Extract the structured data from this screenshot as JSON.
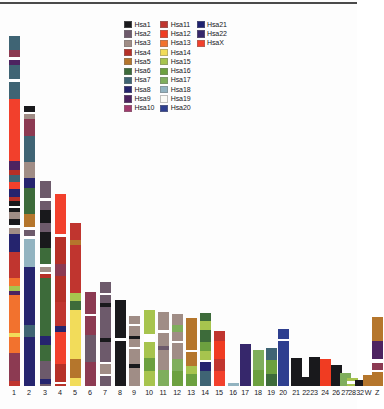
{
  "figure": {
    "title": "",
    "background": "#fdfdfd",
    "top_rule_color": "#4a4a4a"
  },
  "legend": {
    "position": "top-center",
    "columns": [
      [
        {
          "label": "Hsa1",
          "color": "#19191c"
        },
        {
          "label": "Hsa2",
          "color": "#6d5a6b"
        },
        {
          "label": "Hsa3",
          "color": "#a08d86"
        },
        {
          "label": "Hsa4",
          "color": "#b63027"
        },
        {
          "label": "Hsa5",
          "color": "#b5762c"
        },
        {
          "label": "Hsa6",
          "color": "#3d6b3a"
        },
        {
          "label": "Hsa7",
          "color": "#3f6474"
        },
        {
          "label": "Hsa8",
          "color": "#25246e"
        },
        {
          "label": "Hsa9",
          "color": "#4d2360"
        },
        {
          "label": "Hsa10",
          "color": "#a23b6e"
        }
      ],
      [
        {
          "label": "Hsa11",
          "color": "#c0352f"
        },
        {
          "label": "Hsa12",
          "color": "#f03c22"
        },
        {
          "label": "Hsa13",
          "color": "#f2722e"
        },
        {
          "label": "Hsa14",
          "color": "#f2dc5a"
        },
        {
          "label": "Hsa15",
          "color": "#a7c44e"
        },
        {
          "label": "Hsa16",
          "color": "#6ca03f"
        },
        {
          "label": "Hsa17",
          "color": "#7fae5c"
        },
        {
          "label": "Hsa18",
          "color": "#92b3c0"
        },
        {
          "label": "Hsa19",
          "color": "#fbfbf6"
        },
        {
          "label": "Hsa20",
          "color": "#2e3f8f"
        }
      ],
      [
        {
          "label": "Hsa21",
          "color": "#1e2270"
        },
        {
          "label": "Hsa22",
          "color": "#36276b"
        },
        {
          "label": "HsaX",
          "color": "#f2402c"
        }
      ]
    ]
  },
  "chart_data": {
    "type": "bar",
    "subtype": "stacked-chromosome-painting",
    "title": "",
    "xlabel": "",
    "ylabel": "",
    "grid": false,
    "legend_position": "top-center",
    "categories": [
      "1",
      "2",
      "3",
      "4",
      "5",
      "6",
      "7",
      "8",
      "9",
      "10",
      "11",
      "12",
      "13",
      "14",
      "15",
      "16",
      "17",
      "18",
      "19",
      "20",
      "21",
      "22",
      "23",
      "24",
      "26",
      "27",
      "28",
      "32",
      "W",
      "Z"
    ],
    "values": [
      359,
      280,
      205,
      192,
      163,
      94,
      104,
      86,
      70,
      76,
      74,
      72,
      68,
      73,
      55,
      3,
      42,
      36,
      38,
      57,
      28,
      9,
      29,
      27,
      21,
      13,
      8,
      6,
      11,
      69
    ],
    "ylim": [
      0,
      372
    ],
    "bar_left_px": [
      14,
      29,
      45,
      60,
      75,
      90,
      105,
      120,
      134,
      149,
      163,
      177,
      191,
      205,
      219,
      233,
      245,
      258,
      271,
      283,
      296,
      306,
      314,
      325,
      336,
      345,
      352,
      360,
      368,
      377
    ],
    "bars": [
      {
        "name": "1",
        "total": 359,
        "segments": [
          {
            "color": "#3f6474",
            "h": 14
          },
          {
            "color": "#8c3a52",
            "h": 7
          },
          {
            "color": "#ffffff",
            "h": 3
          },
          {
            "color": "#4d2360",
            "h": 5
          },
          {
            "color": "#3f6474",
            "h": 14
          },
          {
            "color": "#ffffff",
            "h": 3
          },
          {
            "color": "#3f6474",
            "h": 17
          },
          {
            "color": "#f2402c",
            "h": 62
          },
          {
            "color": "#4d2360",
            "h": 9
          },
          {
            "color": "#b63027",
            "h": 5
          },
          {
            "color": "#3f6474",
            "h": 7
          },
          {
            "color": "#f2402c",
            "h": 7
          },
          {
            "color": "#25246e",
            "h": 8
          },
          {
            "color": "#b63027",
            "h": 4
          },
          {
            "color": "#19191c",
            "h": 5
          },
          {
            "color": "#ffffff",
            "h": 2
          },
          {
            "color": "#19191c",
            "h": 4
          },
          {
            "color": "#a08d86",
            "h": 7
          },
          {
            "color": "#19191c",
            "h": 6
          },
          {
            "color": "#ffffff",
            "h": 3
          },
          {
            "color": "#a08d86",
            "h": 6
          },
          {
            "color": "#25246e",
            "h": 18
          },
          {
            "color": "#c0352f",
            "h": 26
          },
          {
            "color": "#f2722e",
            "h": 8
          },
          {
            "color": "#a7c44e",
            "h": 5
          },
          {
            "color": "#4d2360",
            "h": 4
          },
          {
            "color": "#f2722e",
            "h": 38
          },
          {
            "color": "#f2dc5a",
            "h": 4
          },
          {
            "color": "#f2722e",
            "h": 16
          },
          {
            "color": "#8c3a52",
            "h": 28
          },
          {
            "color": "#c0352f",
            "h": 5
          }
        ]
      },
      {
        "name": "2",
        "total": 280,
        "segments": [
          {
            "color": "#19191c",
            "h": 6
          },
          {
            "color": "#ffffff",
            "h": 2
          },
          {
            "color": "#a08d86",
            "h": 5
          },
          {
            "color": "#8c3a52",
            "h": 17
          },
          {
            "color": "#3f6474",
            "h": 26
          },
          {
            "color": "#a08d86",
            "h": 16
          },
          {
            "color": "#25246e",
            "h": 10
          },
          {
            "color": "#3d6b3a",
            "h": 26
          },
          {
            "color": "#b5762c",
            "h": 13
          },
          {
            "color": "#ffffff",
            "h": 3
          },
          {
            "color": "#6d5a6b",
            "h": 6
          },
          {
            "color": "#ffffff",
            "h": 3
          },
          {
            "color": "#92b3c0",
            "h": 28
          },
          {
            "color": "#25246e",
            "h": 58
          },
          {
            "color": "#3f6474",
            "h": 12
          },
          {
            "color": "#25246e",
            "h": 49
          }
        ]
      },
      {
        "name": "3",
        "total": 205,
        "segments": [
          {
            "color": "#6d5a6b",
            "h": 17
          },
          {
            "color": "#ffffff",
            "h": 3
          },
          {
            "color": "#6d5a6b",
            "h": 9
          },
          {
            "color": "#19191c",
            "h": 13
          },
          {
            "color": "#6d5a6b",
            "h": 9
          },
          {
            "color": "#19191c",
            "h": 16
          },
          {
            "color": "#3d6b3a",
            "h": 16
          },
          {
            "color": "#ffffff",
            "h": 3
          },
          {
            "color": "#a08d86",
            "h": 5
          },
          {
            "color": "#ffffff",
            "h": 2
          },
          {
            "color": "#b63027",
            "h": 4
          },
          {
            "color": "#3d6b3a",
            "h": 58
          },
          {
            "color": "#25246e",
            "h": 9
          },
          {
            "color": "#3d6b3a",
            "h": 16
          },
          {
            "color": "#6d5a6b",
            "h": 18
          },
          {
            "color": "#25246e",
            "h": 5
          },
          {
            "color": "#6d5a6b",
            "h": 2
          }
        ]
      },
      {
        "name": "4",
        "total": 192,
        "segments": [
          {
            "color": "#f2402c",
            "h": 40
          },
          {
            "color": "#ffffff",
            "h": 3
          },
          {
            "color": "#b63027",
            "h": 27
          },
          {
            "color": "#8c3a52",
            "h": 12
          },
          {
            "color": "#b63027",
            "h": 26
          },
          {
            "color": "#c0352f",
            "h": 24
          },
          {
            "color": "#25246e",
            "h": 6
          },
          {
            "color": "#f2402c",
            "h": 32
          },
          {
            "color": "#b63027",
            "h": 18
          },
          {
            "color": "#ffffff",
            "h": 2
          },
          {
            "color": "#b63027",
            "h": 2
          }
        ]
      },
      {
        "name": "5",
        "total": 163,
        "segments": [
          {
            "color": "#c0352f",
            "h": 17
          },
          {
            "color": "#b5762c",
            "h": 5
          },
          {
            "color": "#c0352f",
            "h": 48
          },
          {
            "color": "#a7c44e",
            "h": 8
          },
          {
            "color": "#3d6b3a",
            "h": 9
          },
          {
            "color": "#f2dc5a",
            "h": 49
          },
          {
            "color": "#b5762c",
            "h": 19
          },
          {
            "color": "#f2dc5a",
            "h": 8
          }
        ]
      },
      {
        "name": "6",
        "total": 94,
        "segments": [
          {
            "color": "#8c3a52",
            "h": 22
          },
          {
            "color": "#ffffff",
            "h": 2
          },
          {
            "color": "#8c3a52",
            "h": 19
          },
          {
            "color": "#6d5a6b",
            "h": 27
          },
          {
            "color": "#8c3a52",
            "h": 24
          }
        ]
      },
      {
        "name": "7",
        "total": 104,
        "segments": [
          {
            "color": "#6d5a6b",
            "h": 11
          },
          {
            "color": "#ffffff",
            "h": 2
          },
          {
            "color": "#6d5a6b",
            "h": 8
          },
          {
            "color": "#19191c",
            "h": 4
          },
          {
            "color": "#6d5a6b",
            "h": 31
          },
          {
            "color": "#19191c",
            "h": 4
          },
          {
            "color": "#6d5a6b",
            "h": 20
          },
          {
            "color": "#ffffff",
            "h": 2
          },
          {
            "color": "#a08d86",
            "h": 10
          },
          {
            "color": "#ffffff",
            "h": 2
          },
          {
            "color": "#6d5a6b",
            "h": 10
          }
        ]
      },
      {
        "name": "8",
        "total": 86,
        "segments": [
          {
            "color": "#19191c",
            "h": 38
          },
          {
            "color": "#ffffff",
            "h": 3
          },
          {
            "color": "#19191c",
            "h": 45
          }
        ]
      },
      {
        "name": "9",
        "total": 70,
        "segments": [
          {
            "color": "#a08d86",
            "h": 8
          },
          {
            "color": "#ffffff",
            "h": 2
          },
          {
            "color": "#a08d86",
            "h": 10
          },
          {
            "color": "#19191c",
            "h": 3
          },
          {
            "color": "#a08d86",
            "h": 8
          },
          {
            "color": "#ffffff",
            "h": 2
          },
          {
            "color": "#a08d86",
            "h": 15
          },
          {
            "color": "#19191c",
            "h": 4
          },
          {
            "color": "#a08d86",
            "h": 18
          }
        ]
      },
      {
        "name": "10",
        "total": 76,
        "segments": [
          {
            "color": "#a7c44e",
            "h": 24
          },
          {
            "color": "#ffffff",
            "h": 8
          },
          {
            "color": "#a7c44e",
            "h": 16
          },
          {
            "color": "#6ca03f",
            "h": 13
          },
          {
            "color": "#a7c44e",
            "h": 15
          }
        ]
      },
      {
        "name": "11",
        "total": 74,
        "segments": [
          {
            "color": "#a08d86",
            "h": 18
          },
          {
            "color": "#ffffff",
            "h": 3
          },
          {
            "color": "#a08d86",
            "h": 13
          },
          {
            "color": "#6d5a6b",
            "h": 4
          },
          {
            "color": "#a08d86",
            "h": 20
          },
          {
            "color": "#7fae5c",
            "h": 16
          }
        ]
      },
      {
        "name": "12",
        "total": 72,
        "segments": [
          {
            "color": "#a08d86",
            "h": 11
          },
          {
            "color": "#7fae5c",
            "h": 7
          },
          {
            "color": "#a08d86",
            "h": 9
          },
          {
            "color": "#ffffff",
            "h": 2
          },
          {
            "color": "#a08d86",
            "h": 16
          },
          {
            "color": "#7fae5c",
            "h": 12
          },
          {
            "color": "#6ca03f",
            "h": 15
          }
        ]
      },
      {
        "name": "13",
        "total": 68,
        "segments": [
          {
            "color": "#b5762c",
            "h": 32
          },
          {
            "color": "#ffffff",
            "h": 2
          },
          {
            "color": "#b5762c",
            "h": 14
          },
          {
            "color": "#a7c44e",
            "h": 8
          },
          {
            "color": "#6ca03f",
            "h": 12
          }
        ]
      },
      {
        "name": "14",
        "total": 73,
        "segments": [
          {
            "color": "#3d6b3a",
            "h": 8
          },
          {
            "color": "#a7c44e",
            "h": 9
          },
          {
            "color": "#3d6b3a",
            "h": 12
          },
          {
            "color": "#6ca03f",
            "h": 9
          },
          {
            "color": "#a7c44e",
            "h": 9
          },
          {
            "color": "#ffffff",
            "h": 2
          },
          {
            "color": "#25246e",
            "h": 9
          },
          {
            "color": "#3f6474",
            "h": 15
          }
        ]
      },
      {
        "name": "15",
        "total": 55,
        "segments": [
          {
            "color": "#c0352f",
            "h": 10
          },
          {
            "color": "#f03c22",
            "h": 18
          },
          {
            "color": "#c0352f",
            "h": 12
          },
          {
            "color": "#f2402c",
            "h": 15
          }
        ]
      },
      {
        "name": "16",
        "total": 3,
        "segments": [
          {
            "color": "#92b3c0",
            "h": 3
          }
        ]
      },
      {
        "name": "17",
        "total": 42,
        "segments": [
          {
            "color": "#36276b",
            "h": 42
          }
        ]
      },
      {
        "name": "18",
        "total": 36,
        "segments": [
          {
            "color": "#7fae5c",
            "h": 20
          },
          {
            "color": "#6ca03f",
            "h": 16
          }
        ]
      },
      {
        "name": "19",
        "total": 38,
        "segments": [
          {
            "color": "#3f6474",
            "h": 12
          },
          {
            "color": "#6ca03f",
            "h": 14
          },
          {
            "color": "#3d6b3a",
            "h": 12
          }
        ]
      },
      {
        "name": "20",
        "total": 57,
        "segments": [
          {
            "color": "#2e3f8f",
            "h": 10
          },
          {
            "color": "#ffffff",
            "h": 2
          },
          {
            "color": "#2e3f8f",
            "h": 45
          }
        ]
      },
      {
        "name": "21",
        "total": 28,
        "segments": [
          {
            "color": "#19191c",
            "h": 28
          }
        ]
      },
      {
        "name": "22",
        "total": 9,
        "segments": [
          {
            "color": "#19191c",
            "h": 9
          }
        ]
      },
      {
        "name": "23",
        "total": 29,
        "segments": [
          {
            "color": "#19191c",
            "h": 29
          }
        ]
      },
      {
        "name": "24",
        "total": 27,
        "segments": [
          {
            "color": "#f03c22",
            "h": 27
          }
        ]
      },
      {
        "name": "26",
        "total": 21,
        "segments": [
          {
            "color": "#19191c",
            "h": 21
          }
        ]
      },
      {
        "name": "27",
        "total": 13,
        "segments": [
          {
            "color": "#7fae5c",
            "h": 13
          }
        ]
      },
      {
        "name": "28",
        "total": 8,
        "segments": [
          {
            "color": "#a7c44e",
            "h": 3
          },
          {
            "color": "#ffffff",
            "h": 3
          },
          {
            "color": "#a7c44e",
            "h": 2
          }
        ]
      },
      {
        "name": "32",
        "total": 6,
        "segments": [
          {
            "color": "#19191c",
            "h": 6
          }
        ]
      },
      {
        "name": "W",
        "total": 11,
        "segments": [
          {
            "color": "#b5762c",
            "h": 11
          }
        ]
      },
      {
        "name": "Z",
        "total": 69,
        "segments": [
          {
            "color": "#b5762c",
            "h": 24
          },
          {
            "color": "#4d2360",
            "h": 18
          },
          {
            "color": "#ffffff",
            "h": 4
          },
          {
            "color": "#8c3a52",
            "h": 7
          },
          {
            "color": "#ffffff",
            "h": 2
          },
          {
            "color": "#b5762c",
            "h": 14
          }
        ]
      }
    ]
  },
  "axis": {
    "tick_labels": [
      "1",
      "2",
      "3",
      "4",
      "5",
      "6",
      "7",
      "8",
      "9",
      "10",
      "11",
      "12",
      "13",
      "14",
      "15",
      "16",
      "17",
      "18",
      "19",
      "20",
      "21",
      "22",
      "23",
      "24",
      "26",
      "27",
      "28",
      "32",
      "W",
      "Z"
    ]
  }
}
